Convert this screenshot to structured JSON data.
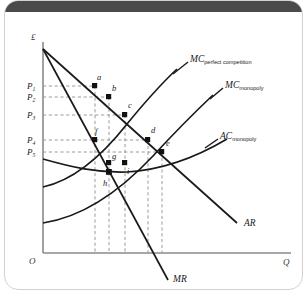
{
  "figure": {
    "axes": {
      "y_label": "£",
      "x_label": "Q",
      "origin_label": "O"
    },
    "price_ticks": [
      {
        "id": "P1",
        "base": "P",
        "sub": "1",
        "y": 85
      },
      {
        "id": "P2",
        "base": "P",
        "sub": "2",
        "y": 96
      },
      {
        "id": "P3",
        "base": "P",
        "sub": "3",
        "y": 114
      },
      {
        "id": "P4",
        "base": "P",
        "sub": "4",
        "y": 139
      },
      {
        "id": "P5",
        "base": "P",
        "sub": "5",
        "y": 151
      }
    ],
    "curves": [
      {
        "name": "MC_perfect_competition",
        "base": "MC",
        "sub": "perfect competition"
      },
      {
        "name": "MC_monopoly",
        "base": "MC",
        "sub": "monopoly"
      },
      {
        "name": "AC_monopoly",
        "base": "AC",
        "sub": "monopoly"
      },
      {
        "name": "AR",
        "base": "AR",
        "sub": ""
      },
      {
        "name": "MR",
        "base": "MR",
        "sub": ""
      }
    ],
    "points": [
      {
        "label": "a",
        "x": 90,
        "y": 85
      },
      {
        "label": "b",
        "x": 104,
        "y": 96
      },
      {
        "label": "c",
        "x": 120,
        "y": 114
      },
      {
        "label": "d",
        "x": 143,
        "y": 139
      },
      {
        "label": "e",
        "x": 157,
        "y": 151
      },
      {
        "label": "f",
        "x": 90,
        "y": 139
      },
      {
        "label": "g",
        "x": 104,
        "y": 162
      },
      {
        "label": "h",
        "x": 104,
        "y": 162
      },
      {
        "label": "i",
        "x": 120,
        "y": 160
      }
    ]
  }
}
